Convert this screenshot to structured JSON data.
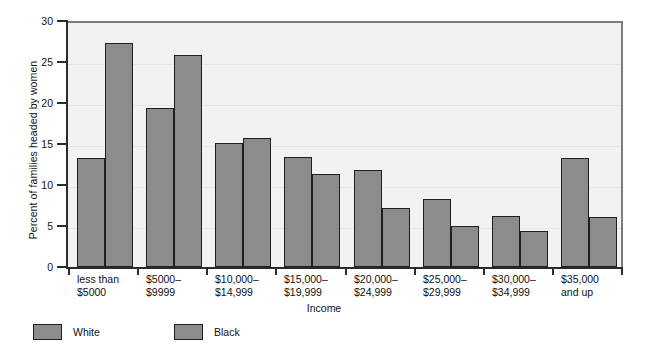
{
  "chart_data": {
    "type": "bar",
    "title": "",
    "xlabel": "Income",
    "ylabel": "Percent of families headed by women",
    "ylim": [
      0,
      30
    ],
    "ytick_values": [
      0,
      5,
      10,
      15,
      20,
      25,
      30
    ],
    "ytick_labels": [
      "0",
      "5",
      "10",
      "15",
      "20",
      "25",
      "30"
    ],
    "grid": true,
    "legend_position": "below-left",
    "categories": [
      "less than\n$5000",
      "$5000–\n$9999",
      "$10,000–\n$14,999",
      "$15,000–\n$19,999",
      "$20,000–\n$24,999",
      "$25,000–\n$29,999",
      "$30,000–\n$34,999",
      "$35,000\nand up"
    ],
    "series": [
      {
        "name": "White",
        "color": "#8c8c8c",
        "values": [
          13.3,
          19.4,
          15.1,
          13.4,
          11.8,
          8.3,
          6.2,
          13.3
        ]
      },
      {
        "name": "Black",
        "color": "#8c8c8c",
        "values": [
          27.3,
          25.8,
          15.7,
          11.3,
          7.2,
          5.0,
          4.4,
          6.1
        ]
      }
    ]
  },
  "legend": {
    "items": [
      {
        "label": "White"
      },
      {
        "label": "Black"
      }
    ]
  },
  "colors": {
    "bar_fill": "#8c8c8c",
    "bar_stroke": "#1f1f1f",
    "plot_background": "#f2f2f2",
    "axis": "#2b2b2b",
    "gridline": "#e6e6e6"
  }
}
